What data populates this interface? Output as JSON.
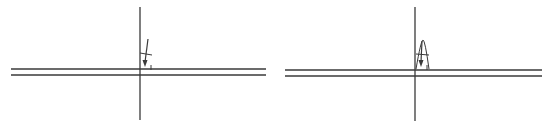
{
  "colors": {
    "background": "#ffffff",
    "stroke": "#3a3a3a"
  },
  "panels": [
    {
      "id": "left",
      "horizontal_lines": [
        {
          "x1": 11,
          "x2": 266,
          "y": 69
        },
        {
          "x1": 11,
          "x2": 266,
          "y": 75
        }
      ],
      "vertical_line": {
        "x": 140,
        "y1": 7,
        "y2": 120
      },
      "arrow": {
        "x1": 148,
        "y1": 39,
        "x2": 145,
        "y2": 67
      },
      "tick": {
        "x1": 140,
        "y1": 53,
        "x2": 152,
        "y2": 55
      },
      "small_mark": {
        "x": 151,
        "y1": 65,
        "y2": 70
      }
    },
    {
      "id": "right",
      "horizontal_lines": [
        {
          "x1": 285,
          "x2": 542,
          "y": 70
        },
        {
          "x1": 285,
          "x2": 542,
          "y": 76
        }
      ],
      "vertical_line": {
        "x": 415,
        "y1": 7,
        "y2": 121
      },
      "arrow": {
        "x1": 422,
        "y1": 41,
        "x2": 421,
        "y2": 67
      },
      "cone": {
        "apex_x": 423,
        "apex_y": 40,
        "left_x": 416,
        "right_x": 429,
        "base_y": 69
      },
      "tick": {
        "x1": 416,
        "y1": 54,
        "x2": 429,
        "y2": 55
      },
      "small_mark": {
        "x": 427,
        "y1": 65,
        "y2": 70
      }
    }
  ]
}
